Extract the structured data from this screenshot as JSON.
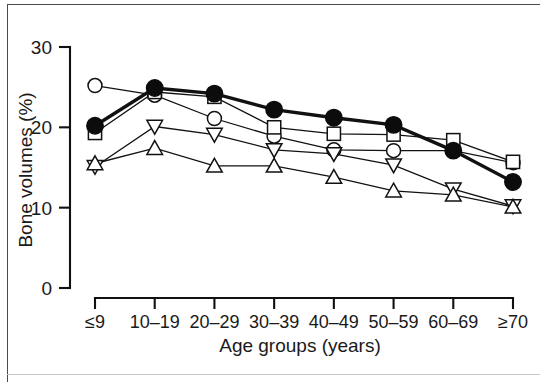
{
  "figure": {
    "background": "#ffffff",
    "frame_color": "#4a4a4a"
  },
  "chart_data": {
    "type": "line",
    "title": "",
    "xlabel": "Age groups (years)",
    "ylabel": "Bone volumes (%)",
    "categories": [
      "≤9",
      "10–19",
      "20–29",
      "30–39",
      "40–49",
      "50–59",
      "60–69",
      "≥70"
    ],
    "x": [
      1,
      2,
      3,
      4,
      5,
      6,
      7,
      8
    ],
    "ylim": [
      0,
      30
    ],
    "yticks": [
      0,
      10,
      20,
      30
    ],
    "ytick_labels": [
      "0",
      "10",
      "20",
      "30"
    ],
    "grid": false,
    "legend": "none",
    "line_color": "#111111",
    "series": [
      {
        "name": "filled-circle-series",
        "marker": "filled-circle",
        "line_width": "thick",
        "values": [
          20.2,
          24.9,
          24.2,
          22.2,
          21.2,
          20.3,
          17.1,
          13.2
        ]
      },
      {
        "name": "open-circle-series",
        "marker": "open-circle",
        "line_width": "thin",
        "values": [
          25.2,
          24.0,
          21.1,
          18.9,
          17.2,
          17.1,
          17.1,
          15.6
        ]
      },
      {
        "name": "open-square-series",
        "marker": "open-square",
        "line_width": "thin",
        "values": [
          19.3,
          24.4,
          23.8,
          20.0,
          19.2,
          19.1,
          18.4,
          15.7
        ]
      },
      {
        "name": "down-triangle-series",
        "marker": "down-triangle",
        "line_width": "thin",
        "values": [
          15.1,
          20.1,
          19.1,
          17.2,
          16.7,
          15.3,
          12.3,
          10.2
        ]
      },
      {
        "name": "up-triangle-series",
        "marker": "up-triangle",
        "line_width": "thin",
        "values": [
          15.5,
          17.4,
          15.2,
          15.2,
          13.8,
          12.1,
          11.6,
          10.1
        ]
      }
    ]
  }
}
